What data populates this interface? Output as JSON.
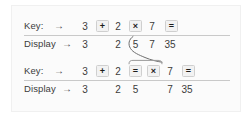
{
  "figure": {
    "kind": "calculator-keystroke-diagram",
    "panel_bg": "#fbfbfb",
    "key_fill": "#f2f2f2",
    "key_border": "#cfcfcf",
    "rule_color": "#c9c9c9",
    "text_color": "#3b3b3b"
  },
  "blocks": [
    {
      "id": "block-1",
      "key_row": {
        "label": "Key:",
        "arrow": "→",
        "tokens": [
          {
            "text": "3",
            "boxed": false
          },
          {
            "text": "+",
            "boxed": true
          },
          {
            "text": "2",
            "boxed": false
          },
          {
            "text": "×",
            "boxed": true
          },
          {
            "text": "7",
            "boxed": false
          },
          {
            "text": "=",
            "boxed": true
          }
        ]
      },
      "display_row": {
        "label": "Display",
        "arrow": "→",
        "tokens": [
          {
            "text": "3",
            "boxed": false
          },
          {
            "text": "",
            "boxed": false
          },
          {
            "text": "2",
            "boxed": false
          },
          {
            "text": "5",
            "boxed": false
          },
          {
            "text": "7",
            "boxed": false
          },
          {
            "text": "35",
            "boxed": false
          }
        ]
      }
    },
    {
      "id": "block-2",
      "key_row": {
        "label": "Key:",
        "arrow": "→",
        "tokens": [
          {
            "text": "3",
            "boxed": false
          },
          {
            "text": "+",
            "boxed": true
          },
          {
            "text": "2",
            "boxed": false
          },
          {
            "text": "=",
            "boxed": true
          },
          {
            "text": "×",
            "boxed": true
          },
          {
            "text": "7",
            "boxed": false
          },
          {
            "text": "=",
            "boxed": true
          }
        ]
      },
      "display_row": {
        "label": "Display",
        "arrow": "→",
        "tokens": [
          {
            "text": "3",
            "boxed": false
          },
          {
            "text": "",
            "boxed": false
          },
          {
            "text": "2",
            "boxed": false
          },
          {
            "text": "5",
            "boxed": false
          },
          {
            "text": "",
            "boxed": false
          },
          {
            "text": "7",
            "boxed": false
          },
          {
            "text": "35",
            "boxed": false
          }
        ]
      }
    }
  ],
  "connector": {
    "kind": "curved-arrow-with-brace",
    "from": "block-1 display value 5",
    "to": "block-2 key sequence = ×"
  }
}
